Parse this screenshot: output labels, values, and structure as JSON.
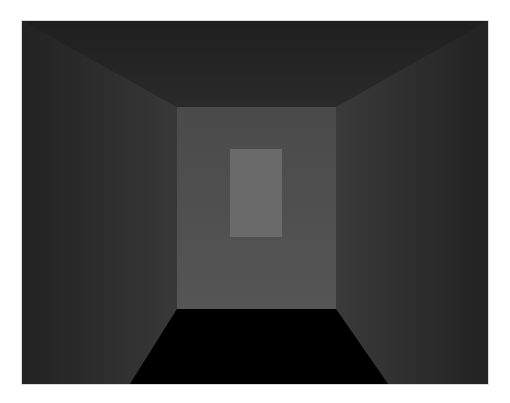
{
  "scene": {
    "type": "3d-corridor-render",
    "colors": {
      "ceiling": "#252525",
      "left_wall": "#2c2c2c",
      "right_wall": "#2e2e2e",
      "back_wall": "#4e4e4e",
      "back_panel": "#6a6a6a",
      "floor": "#000000"
    }
  }
}
